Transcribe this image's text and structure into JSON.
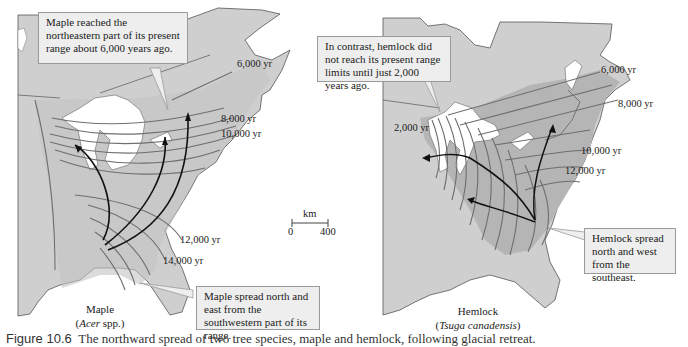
{
  "colors": {
    "land": "#cfcfcf",
    "range_band": "#b5b5b5",
    "isochrone": "#6e6e6e",
    "arrow": "#111111",
    "callout_bg": "#eeeeee",
    "water": "#ffffff"
  },
  "maple_map": {
    "name": "Maple",
    "latin": "Acer",
    "latin_suffix": " spp.)",
    "callout_top": "Maple reached the northeastern part of its present range about 6,000 years ago.",
    "callout_bottom": "Maple spread north and east from the southwestern part of its range.",
    "isochrone_labels": [
      "6,000 yr",
      "8,000 yr",
      "10,000 yr",
      "12,000 yr",
      "14,000 yr"
    ]
  },
  "scale_bar": {
    "unit": "km",
    "min": "0",
    "max": "400"
  },
  "hemlock_map": {
    "name": "Hemlock",
    "latin": "Tsuga canadensis",
    "callout_top": "In contrast, hemlock did not reach its present range limits until just 2,000 years ago.",
    "callout_bottom": "Hemlock spread north and west from the southeast.",
    "isochrone_labels": [
      "6,000 yr",
      "8,000 yr",
      "2,000 yr",
      "10,000 yr",
      "12,000 yr"
    ]
  },
  "caption": {
    "figure": "Figure 10.6",
    "text": "The northward spread of two tree species, maple and hemlock, following glacial retreat."
  }
}
